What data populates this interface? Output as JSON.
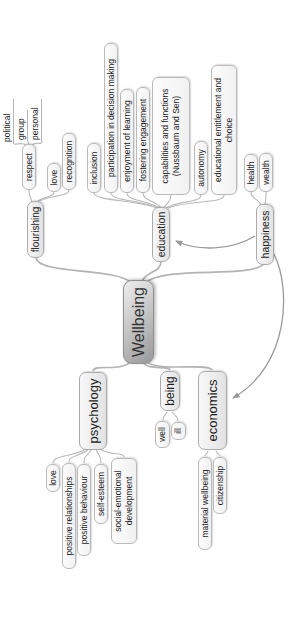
{
  "mindmap": {
    "root": {
      "label": "Wellbeing"
    },
    "branches": [
      {
        "label": "flourishing",
        "children": [
          {
            "label": "respect",
            "children": [
              {
                "label": "political"
              },
              {
                "label": "group"
              },
              {
                "label": "personal"
              }
            ]
          },
          {
            "label": "love"
          },
          {
            "label": "recognition"
          }
        ]
      },
      {
        "label": "education",
        "children": [
          {
            "label": "inclusion"
          },
          {
            "label": "participation in decision making"
          },
          {
            "label": "enjoyment of learning"
          },
          {
            "label": "fostering engagement"
          },
          {
            "label": "capabilities and functions (Nussbaum and Sen)"
          },
          {
            "label": "autonomy"
          },
          {
            "label": "educational entitlement and choice"
          }
        ]
      },
      {
        "label": "happiness",
        "children": [
          {
            "label": "health"
          },
          {
            "label": "wealth"
          }
        ]
      },
      {
        "label": "psychology",
        "children": [
          {
            "label": "love"
          },
          {
            "label": "positive relationships"
          },
          {
            "label": "positive behaviour"
          },
          {
            "label": "self-esteem"
          },
          {
            "label": "social-emotional development"
          }
        ]
      },
      {
        "label": "being",
        "children": [
          {
            "label": "well"
          },
          {
            "label": "ill"
          }
        ]
      },
      {
        "label": "economics",
        "children": [
          {
            "label": "material wellbeing"
          },
          {
            "label": "citizenship"
          }
        ]
      }
    ],
    "arrow_links": [
      {
        "from": "happiness",
        "to": "education"
      },
      {
        "from": "happiness",
        "to": "economics"
      }
    ],
    "colors": {
      "background": "#ffffff",
      "edge": "#b3b3b3",
      "arrow_link": "#999999",
      "node_border": "#b9b9b9",
      "node_fill": "#f5f5f5",
      "root_fill_light": "#efefef",
      "root_fill_dark": "#989898",
      "text": "#1c1c1c"
    }
  }
}
